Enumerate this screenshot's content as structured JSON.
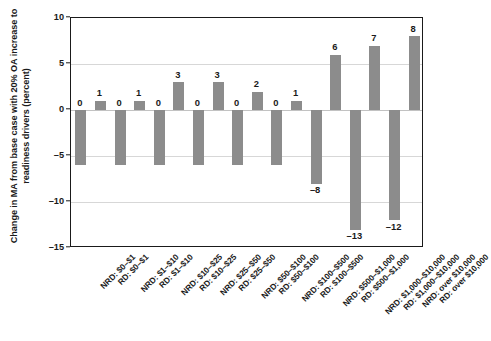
{
  "chart_data": {
    "type": "bar",
    "title": "",
    "xlabel": "",
    "ylabel": "Change in MA from base case with 20% OA increase to readiness drivers (percent)",
    "ylim": [
      -15,
      10
    ],
    "yticks": [
      10,
      5,
      0,
      -5,
      -10,
      -15
    ],
    "ytick_labels": [
      "10",
      "5",
      "0",
      "–5",
      "–10",
      "–15"
    ],
    "grid": true,
    "legend": "none",
    "bar_color": "#8c8c8c",
    "categories": [
      "NRD: $0–$1",
      "RD: $0–$1",
      "NRD: $1–$10",
      "RD: $1–$10",
      "NRD: $10–$25",
      "RD: $10–$25",
      "NRD: $25–$50",
      "RD: $25–$50",
      "NRD: $50–$100",
      "RD: $50–$100",
      "NRD: $100–$500",
      "RD: $100–$500",
      "NRD: $500–$1,000",
      "RD: $500–$1,000",
      "NRD: $1,000–$10,000",
      "RD: $1,000–$10,000",
      "NRD: over $10,000",
      "RD: over $10,000"
    ],
    "values": [
      -6,
      1,
      -6,
      1,
      -6,
      3,
      -6,
      3,
      -6,
      2,
      -6,
      1,
      -8,
      6,
      -13,
      7,
      -12,
      8
    ],
    "value_labels": [
      "0",
      "1",
      "0",
      "1",
      "0",
      "3",
      "0",
      "3",
      "0",
      "2",
      "0",
      "1",
      "–8",
      "6",
      "–13",
      "7",
      "–12",
      "8"
    ]
  }
}
